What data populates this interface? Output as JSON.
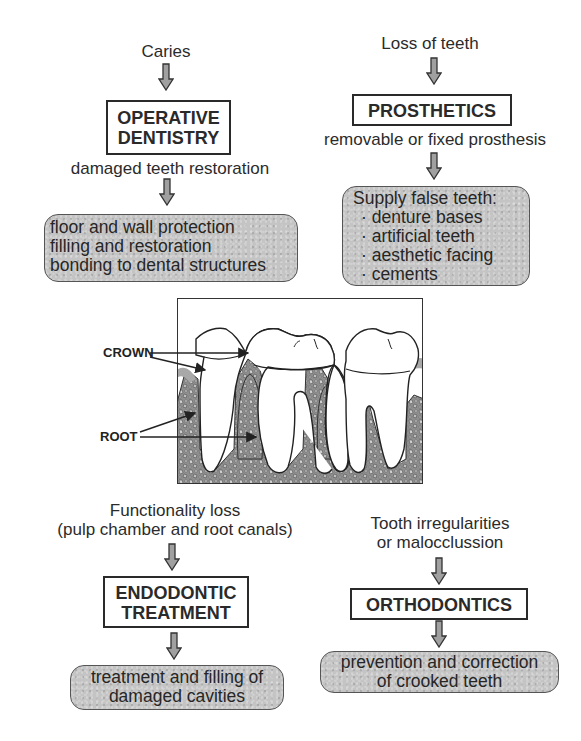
{
  "diagram": {
    "operative": {
      "cause": "Caries",
      "title_lines": [
        "OPERATIVE",
        "DENTISTRY"
      ],
      "description": "damaged teeth restoration",
      "outcomes": [
        "floor and wall protection",
        "filling and restoration",
        "bonding to dental structures"
      ]
    },
    "prosthetics": {
      "cause": "Loss of teeth",
      "title_lines": [
        "PROSTHETICS"
      ],
      "description": "removable or fixed prosthesis",
      "outcome_heading": "Supply false teeth:",
      "outcomes": [
        "· denture bases",
        "· artificial teeth",
        "· aesthetic facing",
        "· cements"
      ]
    },
    "figure": {
      "labels": {
        "crown": "CROWN",
        "root": "ROOT"
      }
    },
    "endodontic": {
      "cause_lines": [
        "Functionality loss",
        "(pulp chamber and root canals)"
      ],
      "title_lines": [
        "ENDODONTIC",
        "TREATMENT"
      ],
      "outcomes": [
        "treatment and filling of",
        "damaged cavities"
      ]
    },
    "orthodontics": {
      "cause_lines": [
        "Tooth irregularities",
        "or malocclussion"
      ],
      "title_lines": [
        "ORTHODONTICS"
      ],
      "outcomes": [
        "prevention and correction",
        "of crooked teeth"
      ]
    },
    "colors": {
      "box_fill": "#c4c4c4",
      "line": "#2a2a2a",
      "arrow_fill": "#9a9a9a",
      "bone": "#8c8c8c",
      "gum": "#a8a8a8"
    }
  }
}
